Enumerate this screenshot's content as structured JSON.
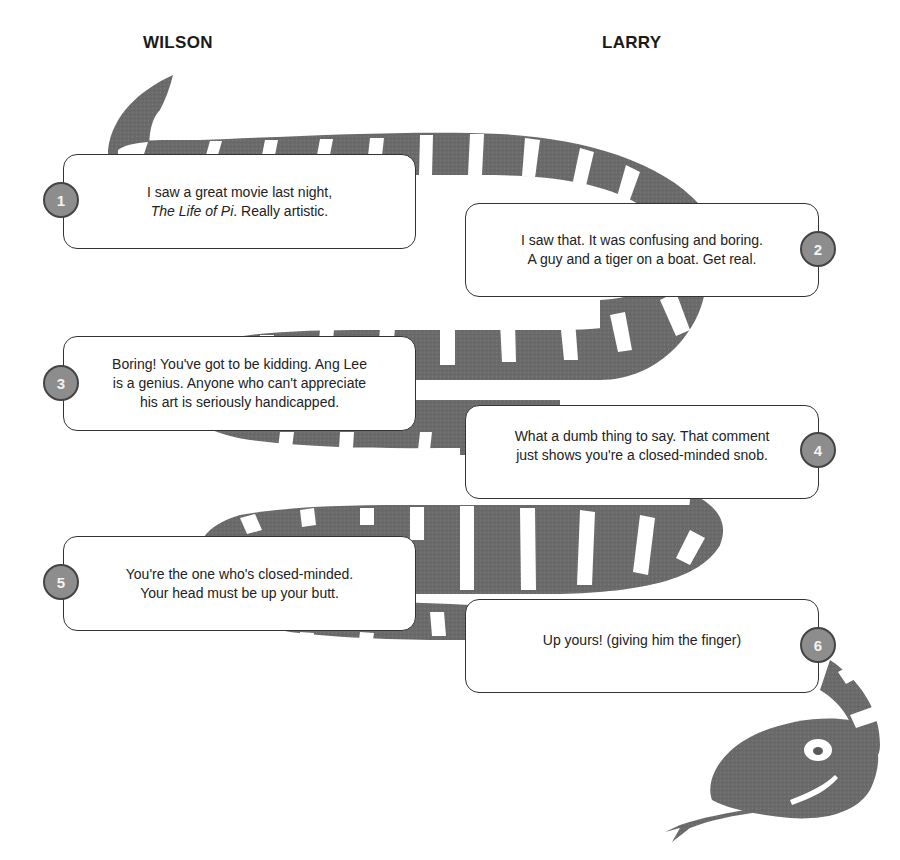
{
  "headers": {
    "left": "WILSON",
    "right": "LARRY"
  },
  "colors": {
    "snake_body": "#6b6b6b",
    "snake_stripe": "#ffffff",
    "badge_fill": "#8d8d8d",
    "badge_border": "#444444",
    "bubble_border": "#333333"
  },
  "exchanges": [
    {
      "number": "1",
      "speaker": "WILSON",
      "lines": [
        "I saw a great movie last night,"
      ],
      "italic": "The Life of Pi",
      "after_italic": ". Really artistic."
    },
    {
      "number": "2",
      "speaker": "LARRY",
      "lines": [
        "I saw that. It was confusing and boring.",
        "A guy and a tiger on a boat. Get real."
      ]
    },
    {
      "number": "3",
      "speaker": "WILSON",
      "lines": [
        "Boring! You've got to be kidding. Ang Lee",
        "is a genius. Anyone who can't appreciate",
        "his art is seriously handicapped."
      ]
    },
    {
      "number": "4",
      "speaker": "LARRY",
      "lines": [
        "What a dumb thing to say. That comment",
        "just shows you're a closed-minded snob."
      ]
    },
    {
      "number": "5",
      "speaker": "WILSON",
      "lines": [
        "You're the one who's closed-minded.",
        "Your head must be up your butt."
      ]
    },
    {
      "number": "6",
      "speaker": "LARRY",
      "lines": [
        "Up yours! (giving him the finger)"
      ]
    }
  ],
  "icons": {
    "snake": "snake-illustration"
  }
}
